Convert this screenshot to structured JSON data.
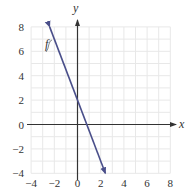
{
  "chart_data": {
    "type": "line",
    "title": "",
    "xlabel": "x",
    "ylabel": "y",
    "xlim": [
      -4,
      8
    ],
    "ylim": [
      -4,
      8
    ],
    "grid": true,
    "grid_step": 1,
    "x_ticks": [
      -4,
      -2,
      0,
      2,
      4,
      6,
      8
    ],
    "y_ticks": [
      -4,
      -2,
      0,
      2,
      4,
      6,
      8
    ],
    "x_tick_labels": [
      "−4",
      "−2",
      "0",
      "2",
      "4",
      "6",
      "8"
    ],
    "y_tick_labels": [
      "−4",
      "−2",
      "0",
      "2",
      "4",
      "6",
      "8"
    ],
    "series": [
      {
        "name": "f",
        "equation": "y = -2.5x + 2",
        "x": [
          -2.4,
          2.4
        ],
        "y": [
          8,
          -4
        ],
        "arrows": "both",
        "color": "#4a4f8a"
      }
    ],
    "annotations": [
      {
        "text": "f",
        "x": -3.6,
        "y": 6.2
      }
    ]
  },
  "labels": {
    "x_axis": "x",
    "y_axis": "y",
    "function_label": "f"
  },
  "colors": {
    "line": "#4a4f8a",
    "axis": "#333333",
    "grid": "#e6e6e6"
  }
}
